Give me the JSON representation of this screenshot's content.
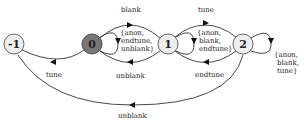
{
  "diagram": {
    "type": "state-machine",
    "states": [
      {
        "id": "s-1",
        "label": "-1",
        "fill": "#eeeeee"
      },
      {
        "id": "s0",
        "label": "0",
        "fill": "#777777"
      },
      {
        "id": "s1",
        "label": "1",
        "fill": "#eeeeee"
      },
      {
        "id": "s2",
        "label": "2",
        "fill": "#eeeeee"
      }
    ],
    "transitions": [
      {
        "from": "0",
        "to": "1",
        "label": "blank"
      },
      {
        "from": "1",
        "to": "0",
        "label": "unblank"
      },
      {
        "from": "0",
        "to": "-1",
        "label": "tune"
      },
      {
        "from": "1",
        "to": "2",
        "label": "tune"
      },
      {
        "from": "2",
        "to": "1",
        "label": "endtune"
      },
      {
        "from": "2",
        "to": "-1",
        "label": "unblank"
      },
      {
        "from": "0",
        "to": "0",
        "label_lines": [
          "{anon,",
          "endtune,",
          "unblank}"
        ]
      },
      {
        "from": "1",
        "to": "1",
        "label_lines": [
          "{anon,",
          "blank,",
          "endtune}"
        ]
      },
      {
        "from": "2",
        "to": "2",
        "label_lines": [
          "{anon,",
          "blank,",
          "tune}"
        ]
      }
    ]
  }
}
